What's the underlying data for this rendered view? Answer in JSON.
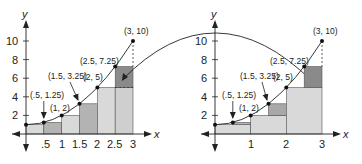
{
  "figure": {
    "colors": {
      "light": "#d9d9d9",
      "medium": "#b3b3b3",
      "dark": "#8a8a8a",
      "line": "#222222"
    },
    "left_chart": {
      "x_axis_label": "x",
      "y_axis_label": "y",
      "x_ticks": [
        ".5",
        "1",
        "1.5",
        "2",
        "2.5",
        "3"
      ],
      "y_ticks": [
        "2",
        "4",
        "6",
        "8",
        "10"
      ],
      "points": [
        {
          "label": "(.5, 1.25)"
        },
        {
          "label": "(1, 2)"
        },
        {
          "label": "(1.5, 3.25)"
        },
        {
          "label": "(2, 5)"
        },
        {
          "label": "(2.5, 7.25)"
        },
        {
          "label": "(3, 10)"
        }
      ]
    },
    "right_chart": {
      "x_axis_label": "x",
      "y_axis_label": "y",
      "x_ticks": [
        "1",
        "2",
        "3"
      ],
      "y_ticks": [
        "2",
        "4",
        "6",
        "8",
        "10"
      ],
      "points": [
        {
          "label": "(.5, 1.25)"
        },
        {
          "label": "(1, 2)"
        },
        {
          "label": "(1.5, 3.25)"
        },
        {
          "label": "(2, 5)"
        },
        {
          "label": "(2.5, 7.25)"
        },
        {
          "label": "(3, 10)"
        }
      ]
    }
  }
}
